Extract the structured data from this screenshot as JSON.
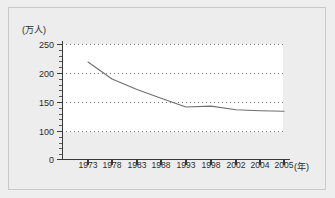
{
  "chart_data": {
    "type": "line",
    "title": "",
    "subtitle": "",
    "xlabel": "(年)",
    "ylabel": "(万人)",
    "x": [
      1973,
      1978,
      1983,
      1988,
      1993,
      1998,
      2002,
      2004,
      2005
    ],
    "xtick_labels": [
      "1973",
      "1978",
      "1983",
      "1988",
      "1993",
      "1998",
      "2002",
      "2004",
      "2005"
    ],
    "values": [
      212,
      175,
      152,
      133,
      114,
      116,
      108,
      106,
      105
    ],
    "series": [
      {
        "name": "",
        "values": [
          212,
          175,
          152,
          133,
          114,
          116,
          108,
          106,
          105
        ]
      }
    ],
    "ylim": [
      0,
      250
    ],
    "ytick_labels": [
      "0",
      "100",
      "150",
      "200",
      "250"
    ],
    "ytick_values": [
      0,
      100,
      150,
      200,
      250
    ],
    "gridline_values": [
      100,
      150,
      200,
      250
    ],
    "grid": true,
    "grid_style": "dotted",
    "legend": "none",
    "line_color": "#6f6f6f",
    "grid_color": "#7a7a7a",
    "axis_color": "#3a3a3a",
    "background_color": "#ededed",
    "plot_background_color": "#ffffff"
  },
  "axis": {
    "y_unit_label": "(万人)",
    "x_unit_label": "(年)"
  }
}
